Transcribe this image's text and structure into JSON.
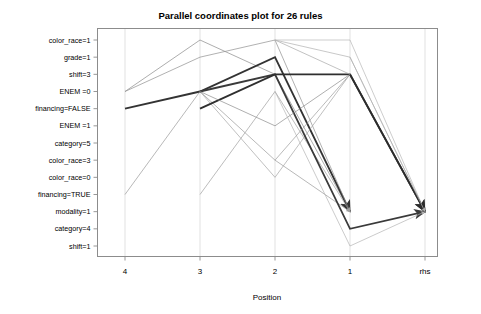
{
  "chart_data": {
    "type": "line",
    "title": "Parallel coordinates plot for 26 rules",
    "xlabel": "Position",
    "ylabel": "",
    "legend": "none",
    "grid": true,
    "categories": [
      "4",
      "3",
      "2",
      "1",
      "rhs"
    ],
    "y_categories": [
      "color_race=1",
      "grade=1",
      "shift=3",
      "ENEM =0",
      "financing=FALSE",
      "ENEM =1",
      "category=5",
      "color_race=3",
      "color_race=0",
      "financing=TRUE",
      "modality=1",
      "category=4",
      "shift=1"
    ],
    "x_tick_labels": [
      "4",
      "3",
      "2",
      "1",
      "rhs"
    ],
    "y_tick_labels": [
      "color_race=1",
      "grade=1",
      "shift=3",
      "ENEM =0",
      "financing=FALSE",
      "ENEM =1",
      "category=5",
      "color_race=3",
      "color_race=0",
      "financing=TRUE",
      "modality=1",
      "category=4",
      "shift=1"
    ],
    "arrow_target": "modality=1",
    "rule_count": 26,
    "series": [
      {
        "name": "rule-1",
        "points": [
          [
            1,
            "ENEM =0"
          ],
          [
            2,
            "color_race=1"
          ],
          [
            3,
            "shift=3"
          ],
          [
            4,
            "modality=1"
          ]
        ],
        "width": 0.7,
        "shade": "#8a8a8a"
      },
      {
        "name": "rule-2",
        "points": [
          [
            1,
            "financing=FALSE"
          ],
          [
            2,
            "ENEM =0"
          ],
          [
            3,
            "grade=1"
          ],
          [
            4,
            "modality=1"
          ]
        ],
        "width": 1.9,
        "shade": "#333333"
      },
      {
        "name": "rule-3",
        "points": [
          [
            1,
            "ENEM =0"
          ],
          [
            2,
            "grade=1"
          ],
          [
            3,
            "color_race=1"
          ],
          [
            4,
            "modality=1"
          ]
        ],
        "width": 0.7,
        "shade": "#8f8f8f"
      },
      {
        "name": "rule-4",
        "points": [
          [
            1,
            "financing=TRUE"
          ],
          [
            2,
            "ENEM =0"
          ],
          [
            3,
            "color_race=3"
          ],
          [
            4,
            "modality=1"
          ]
        ],
        "width": 0.7,
        "shade": "#9a9a9a"
      },
      {
        "name": "rule-5",
        "points": [
          [
            2,
            "financing=TRUE"
          ],
          [
            3,
            "ENEM =0"
          ],
          [
            4,
            "modality=1"
          ]
        ],
        "width": 0.7,
        "shade": "#9f9f9f"
      },
      {
        "name": "rule-6",
        "points": [
          [
            2,
            "ENEM =0"
          ],
          [
            3,
            "color_race=0"
          ],
          [
            4,
            "shift=3"
          ],
          [
            5,
            "modality=1"
          ]
        ],
        "width": 0.7,
        "shade": "#a5a5a5"
      },
      {
        "name": "rule-7",
        "points": [
          [
            2,
            "ENEM =0"
          ],
          [
            3,
            "shift=3"
          ],
          [
            4,
            "category=4"
          ],
          [
            5,
            "modality=1"
          ]
        ],
        "width": 1.8,
        "shade": "#3a3a3a"
      },
      {
        "name": "rule-8",
        "points": [
          [
            2,
            "financing=FALSE"
          ],
          [
            3,
            "shift=3"
          ],
          [
            4,
            "shift=3"
          ],
          [
            5,
            "modality=1"
          ]
        ],
        "width": 1.9,
        "shade": "#2f2f2f"
      },
      {
        "name": "rule-9",
        "points": [
          [
            2,
            "ENEM =0"
          ],
          [
            3,
            "ENEM =1"
          ],
          [
            4,
            "shift=3"
          ],
          [
            5,
            "modality=1"
          ]
        ],
        "width": 0.7,
        "shade": "#8d8d8d"
      },
      {
        "name": "rule-10",
        "points": [
          [
            3,
            "color_race=1"
          ],
          [
            4,
            "grade=1"
          ],
          [
            5,
            "modality=1"
          ]
        ],
        "width": 0.7,
        "shade": "#b0b0b0"
      },
      {
        "name": "rule-11",
        "points": [
          [
            3,
            "color_race=1"
          ],
          [
            4,
            "shift=3"
          ],
          [
            5,
            "modality=1"
          ]
        ],
        "width": 0.7,
        "shade": "#a8a8a8"
      },
      {
        "name": "rule-12",
        "points": [
          [
            3,
            "ENEM =0"
          ],
          [
            4,
            "shift=1"
          ],
          [
            5,
            "modality=1"
          ]
        ],
        "width": 0.7,
        "shade": "#b4b4b4"
      },
      {
        "name": "rule-13",
        "points": [
          [
            3,
            "color_race=3"
          ],
          [
            4,
            "shift=3"
          ],
          [
            5,
            "modality=1"
          ]
        ],
        "width": 0.7,
        "shade": "#9c9c9c"
      },
      {
        "name": "rule-14",
        "points": [
          [
            3,
            "color_race=1"
          ],
          [
            4,
            "color_race=1"
          ],
          [
            5,
            "modality=1"
          ]
        ],
        "width": 0.7,
        "shade": "#b8b8b8"
      },
      {
        "name": "rule-15",
        "points": [
          [
            4,
            "shift=3"
          ],
          [
            5,
            "modality=1"
          ]
        ],
        "width": 1.9,
        "shade": "#2b2b2b"
      },
      {
        "name": "rule-16",
        "points": [
          [
            4,
            "grade=1"
          ],
          [
            5,
            "modality=1"
          ]
        ],
        "width": 0.7,
        "shade": "#b2b2b2"
      }
    ]
  },
  "axes": {
    "x_axis_title": "Position",
    "x_ticks": [
      "4",
      "3",
      "2",
      "1",
      "rhs"
    ],
    "y_ticks": [
      "color_race=1",
      "grade=1",
      "shift=3",
      "ENEM =0",
      "financing=FALSE",
      "ENEM =1",
      "category=5",
      "color_race=3",
      "color_race=0",
      "financing=TRUE",
      "modality=1",
      "category=4",
      "shift=1"
    ]
  },
  "colors": {
    "frame": "#8c8c8c",
    "grid": "#d9d9d9",
    "text": "#000000",
    "line_dark": "#2b2b2b",
    "line_light": "#b8b8b8",
    "background": "#ffffff"
  }
}
